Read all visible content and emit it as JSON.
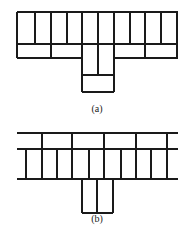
{
  "figures": [
    {
      "id": "a",
      "caption": "(a)",
      "caption_pos": {
        "x": 97,
        "y": 103
      },
      "h_lines": [
        {
          "x1": 17,
          "x2": 178,
          "y": 12
        },
        {
          "x1": 17,
          "x2": 178,
          "y": 44
        },
        {
          "x1": 17,
          "x2": 82,
          "y": 58
        },
        {
          "x1": 114,
          "x2": 178,
          "y": 58
        },
        {
          "x1": 82,
          "x2": 114,
          "y": 75
        },
        {
          "x1": 82,
          "x2": 114,
          "y": 92
        }
      ],
      "v_lines": [
        {
          "x": 17,
          "y1": 12,
          "y2": 58
        },
        {
          "x": 35,
          "y1": 12,
          "y2": 44
        },
        {
          "x": 51,
          "y1": 12,
          "y2": 58
        },
        {
          "x": 67,
          "y1": 12,
          "y2": 44
        },
        {
          "x": 82,
          "y1": 12,
          "y2": 92
        },
        {
          "x": 98,
          "y1": 12,
          "y2": 75
        },
        {
          "x": 114,
          "y1": 12,
          "y2": 92
        },
        {
          "x": 130,
          "y1": 12,
          "y2": 44
        },
        {
          "x": 145,
          "y1": 12,
          "y2": 58
        },
        {
          "x": 161,
          "y1": 12,
          "y2": 44
        },
        {
          "x": 177,
          "y1": 12,
          "y2": 58
        }
      ]
    },
    {
      "id": "b",
      "caption": "(b)",
      "caption_pos": {
        "x": 97,
        "y": 213
      },
      "h_lines": [
        {
          "x1": 17,
          "x2": 178,
          "y": 133
        },
        {
          "x1": 17,
          "x2": 178,
          "y": 149
        },
        {
          "x1": 17,
          "x2": 178,
          "y": 179
        },
        {
          "x1": 82,
          "x2": 113,
          "y": 213
        }
      ],
      "v_lines": [
        {
          "x": 42,
          "y1": 133,
          "y2": 179
        },
        {
          "x": 72,
          "y1": 133,
          "y2": 179
        },
        {
          "x": 104,
          "y1": 133,
          "y2": 179
        },
        {
          "x": 136,
          "y1": 133,
          "y2": 179
        },
        {
          "x": 167,
          "y1": 133,
          "y2": 179
        },
        {
          "x": 26,
          "y1": 149,
          "y2": 179
        },
        {
          "x": 57,
          "y1": 149,
          "y2": 179
        },
        {
          "x": 89,
          "y1": 149,
          "y2": 179
        },
        {
          "x": 121,
          "y1": 149,
          "y2": 179
        },
        {
          "x": 151,
          "y1": 149,
          "y2": 179
        },
        {
          "x": 82,
          "y1": 179,
          "y2": 213
        },
        {
          "x": 97,
          "y1": 179,
          "y2": 213
        },
        {
          "x": 113,
          "y1": 179,
          "y2": 213
        }
      ]
    }
  ]
}
